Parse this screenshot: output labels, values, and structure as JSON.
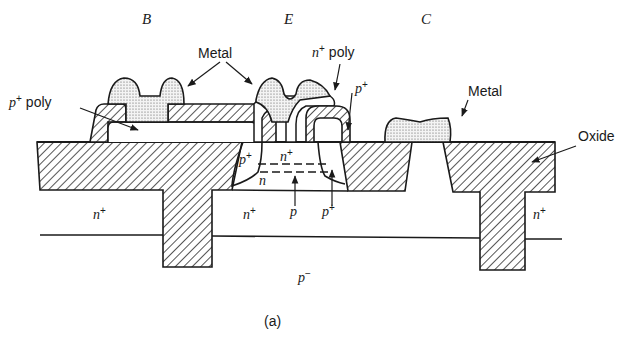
{
  "figure": {
    "caption": "(a)",
    "terminals": {
      "base": "B",
      "emitter": "E",
      "collector": "C"
    },
    "callouts": {
      "metal_top": "Metal",
      "metal_right": "Metal",
      "p_poly": "p",
      "p_poly_sup": "+",
      "p_poly_word": "poly",
      "n_poly": "n",
      "n_poly_sup": "+",
      "n_poly_word": "poly",
      "p_plus_top": "p",
      "p_plus_top_sup": "+",
      "oxide": "Oxide"
    },
    "regions": {
      "p_plus_base": "p",
      "p_plus_base_sup": "+",
      "n_plus_emitter": "n",
      "n_plus_emitter_sup": "+",
      "n_collector": "n",
      "p_base": "p",
      "p_plus_bottom": "p",
      "p_plus_bottom_sup": "+",
      "n_plus_buried_left": "n",
      "n_plus_buried_left_sup": "+",
      "n_plus_buried_mid": "n",
      "n_plus_buried_mid_sup": "+",
      "n_plus_buried_right": "n",
      "n_plus_buried_right_sup": "+",
      "p_minus_substrate": "p",
      "p_minus_substrate_sup": "−"
    },
    "colors": {
      "line": "#1a1a1a",
      "hatch": "#2a2a2a",
      "metal_dots": "#555555",
      "background": "#ffffff"
    }
  }
}
